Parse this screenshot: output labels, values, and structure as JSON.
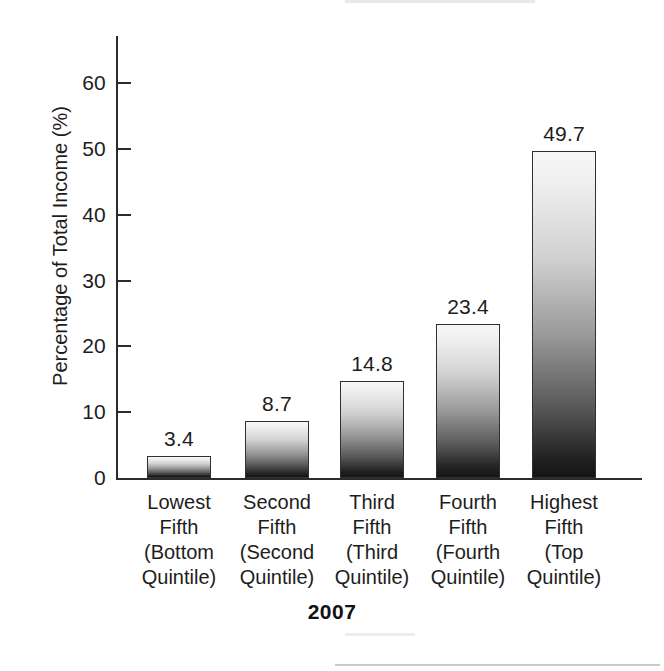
{
  "chart_data": {
    "type": "bar",
    "title": "",
    "subtitle": "",
    "xlabel": "2007",
    "ylabel": "Percentage of Total Income (%)",
    "categories": [
      "Lowest Fifth (Bottom Quintile)",
      "Second Fifth (Second Quintile)",
      "Third Fifth (Third Quintile)",
      "Fourth Fifth (Fourth Quintile)",
      "Highest Fifth (Top Quintile)"
    ],
    "category_lines": [
      [
        "Lowest",
        "Fifth",
        "(Bottom",
        "Quintile)"
      ],
      [
        "Second",
        "Fifth",
        "(Second",
        "Quintile)"
      ],
      [
        "Third",
        "Fifth",
        "(Third",
        "Quintile)"
      ],
      [
        "Fourth",
        "Fifth",
        "(Fourth",
        "Quintile)"
      ],
      [
        "Highest",
        "Fifth",
        "(Top",
        "Quintile)"
      ]
    ],
    "values": [
      3.4,
      8.7,
      14.8,
      23.4,
      49.7
    ],
    "value_labels": [
      "3.4",
      "8.7",
      "14.8",
      "23.4",
      "49.7"
    ],
    "ylim": [
      0,
      65
    ],
    "yticks": [
      0,
      10,
      20,
      30,
      40,
      50,
      60
    ],
    "ytick_labels": [
      "0",
      "10",
      "20",
      "30",
      "40",
      "50",
      "60"
    ],
    "grid": false,
    "legend": "none",
    "bar_fill": "vertical gradient light-to-dark",
    "bar_color_top": "#f7f7f7",
    "bar_color_bottom": "#141414",
    "axis_color": "#2b2b2b",
    "text_color": "#1d1d1d"
  }
}
